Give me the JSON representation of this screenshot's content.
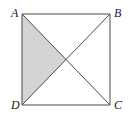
{
  "figure": {
    "type": "geometry-diagram",
    "background_color": "#ffffff",
    "stroke_color": "#4a4a4a",
    "stroke_width": 1,
    "shaded_fill_color": "#d4d4d4",
    "unshaded_fill_color": "#ffffff",
    "square": {
      "name": "ABCD",
      "corners": {
        "A": {
          "label": "A",
          "x": 22,
          "y": 14,
          "position": "top-left"
        },
        "B": {
          "label": "B",
          "x": 110,
          "y": 14,
          "position": "top-right"
        },
        "C": {
          "label": "C",
          "x": 110,
          "y": 105,
          "position": "bottom-right"
        },
        "D": {
          "label": "D",
          "x": 22,
          "y": 105,
          "position": "bottom-left"
        }
      },
      "width": 88,
      "height": 91
    },
    "center": {
      "label": "",
      "x": 66,
      "y": 59.5
    },
    "diagonals": [
      {
        "name": "diagonal-AC",
        "from": "A",
        "to": "C"
      },
      {
        "name": "diagonal-BD",
        "from": "B",
        "to": "D"
      }
    ],
    "shaded_region": {
      "name": "triangle-A-D-center",
      "vertices": [
        "A",
        "D",
        "center"
      ],
      "fill": "#d4d4d4"
    },
    "labels": {
      "A": "A",
      "B": "B",
      "C": "C",
      "D": "D"
    }
  }
}
